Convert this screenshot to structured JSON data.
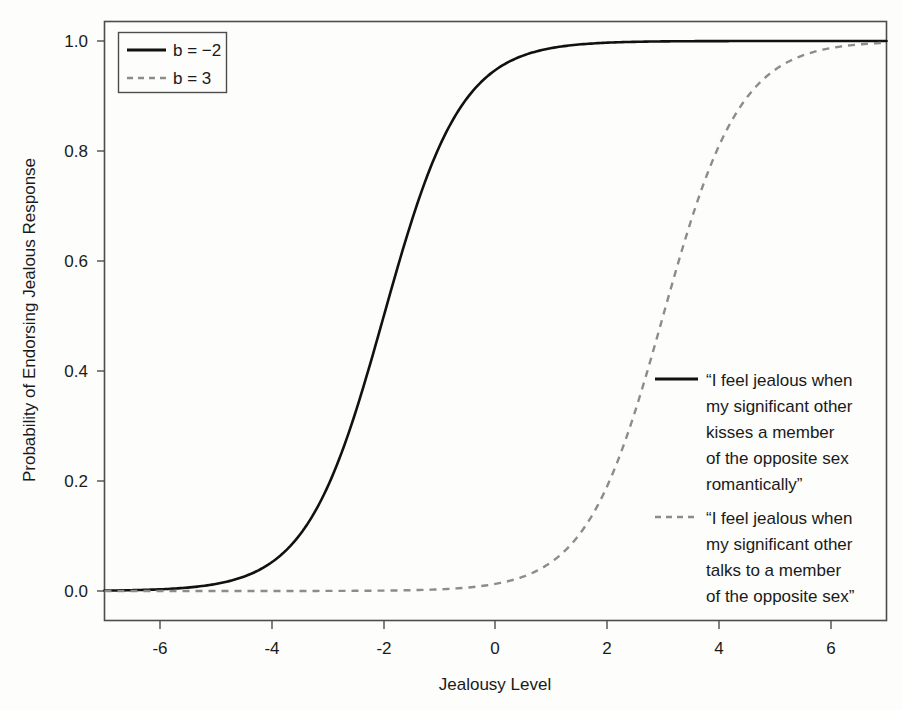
{
  "chart_data": {
    "type": "line",
    "title": "",
    "xlabel": "Jealousy Level",
    "ylabel": "Probability of Endorsing Jealous Response",
    "xlim": [
      -7,
      7
    ],
    "ylim": [
      0.0,
      1.0
    ],
    "grid": false,
    "legend_position": "top-left",
    "xticks": [
      "-6",
      "-4",
      "-2",
      "0",
      "2",
      "4",
      "6"
    ],
    "xtick_values": [
      -6,
      -4,
      -2,
      0,
      2,
      4,
      6
    ],
    "yticks": [
      "0.0",
      "0.2",
      "0.4",
      "0.6",
      "0.8",
      "1.0"
    ],
    "ytick_values": [
      0.0,
      0.2,
      0.4,
      0.6,
      0.8,
      1.0
    ],
    "x": [
      -7,
      -6.5,
      -6,
      -5.5,
      -5,
      -4.5,
      -4,
      -3.5,
      -3,
      -2.5,
      -2,
      -1.5,
      -1,
      -0.5,
      0,
      0.5,
      1,
      1.5,
      2,
      2.5,
      3,
      3.5,
      4,
      4.5,
      5,
      5.5,
      6,
      6.5,
      7
    ],
    "series": [
      {
        "name": "b = -2",
        "style": "solid",
        "color": "#111111",
        "slope": 0.85,
        "threshold": -2,
        "values": [
          0.014,
          0.021,
          0.032,
          0.048,
          0.072,
          0.107,
          0.154,
          0.218,
          0.299,
          0.395,
          0.5,
          0.605,
          0.701,
          0.782,
          0.846,
          0.893,
          0.928,
          0.952,
          0.968,
          0.979,
          0.986,
          0.991,
          0.994,
          0.996,
          0.997,
          0.998,
          0.999,
          0.999,
          0.999
        ]
      },
      {
        "name": "b = 3",
        "style": "dashed",
        "color": "#8c8c8c",
        "slope": 0.85,
        "threshold": 3,
        "values": [
          0.002,
          0.003,
          0.005,
          0.007,
          0.011,
          0.016,
          0.024,
          0.036,
          0.054,
          0.08,
          0.116,
          0.167,
          0.234,
          0.317,
          0.413,
          0.513,
          0.611,
          0.7,
          0.775,
          0.835,
          0.88,
          0.914,
          0.939,
          0.957,
          0.969,
          0.978,
          0.984,
          0.989,
          0.992
        ]
      }
    ],
    "annotations": [
      {
        "style": "solid",
        "color": "#111111",
        "lines": [
          "“I feel jealous when",
          "my significant other",
          "kisses a member",
          "of the opposite sex",
          "romantically”"
        ]
      },
      {
        "style": "dashed",
        "color": "#8c8c8c",
        "lines": [
          "“I feel jealous when",
          "my significant other",
          "talks to a member",
          "of the opposite sex”"
        ]
      }
    ]
  },
  "legend": {
    "entries": [
      {
        "label": "b = −2",
        "style": "solid",
        "color": "#111111"
      },
      {
        "label": "b = 3",
        "style": "dashed",
        "color": "#8c8c8c"
      }
    ]
  },
  "colors": {
    "background": "#fdfdfb",
    "frame": "#4d4d4d",
    "text": "#1a1a1a",
    "solid_series": "#111111",
    "dashed_series": "#8c8c8c"
  }
}
